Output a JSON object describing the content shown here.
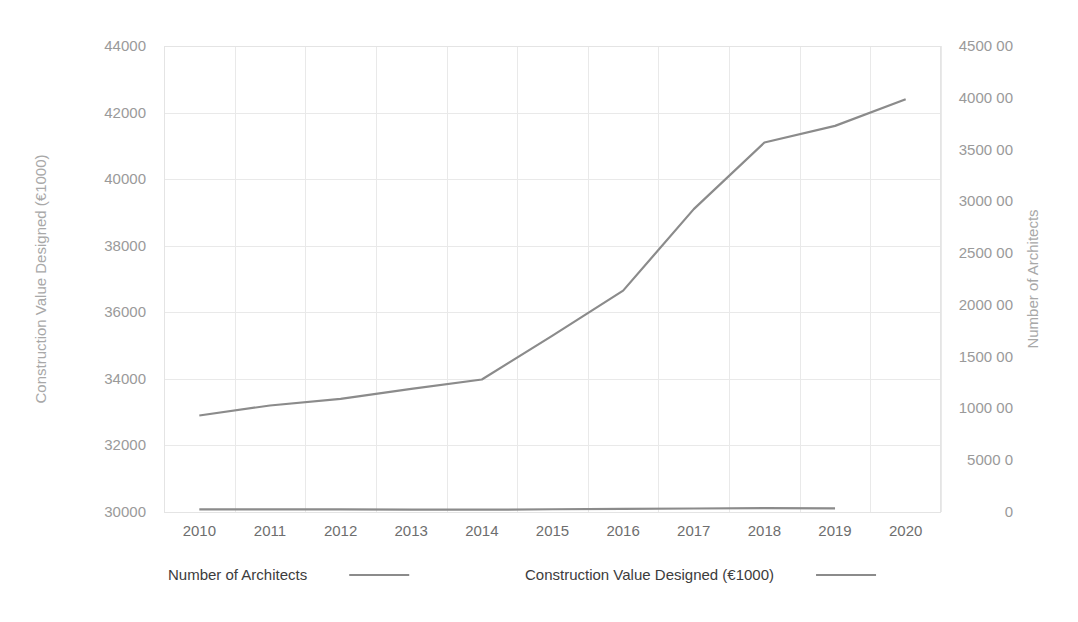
{
  "chart_data": {
    "type": "line",
    "title": "",
    "xlabel": "",
    "ylabel": "Construction Value Designed (€1000)",
    "y2label": "Number of Architects",
    "grid": true,
    "legend_position": "bottom",
    "categories": [
      "2010",
      "2011",
      "2012",
      "2013",
      "2014",
      "2015",
      "2016",
      "2017",
      "2018",
      "2019",
      "2020"
    ],
    "x_tick_labels": [
      "2010",
      "2011",
      "2012",
      "2013",
      "2014",
      "2015",
      "2016",
      "2017",
      "2018",
      "2019",
      "2020"
    ],
    "ylim": [
      30000,
      44000
    ],
    "y_tick_labels": [
      "44000",
      "42000",
      "40000",
      "38000",
      "36000",
      "34000",
      "32000",
      "30000"
    ],
    "y_tick_values": [
      44000,
      42000,
      40000,
      38000,
      36000,
      34000,
      32000,
      30000
    ],
    "y2lim": [
      0,
      450000
    ],
    "y2_tick_labels": [
      "4500 00",
      "4000 00",
      "3500 00",
      "3000 00",
      "2500 00",
      "2000 00",
      "1500 00",
      "1000 00",
      "5000 0",
      "0"
    ],
    "y2_tick_values": [
      450000,
      400000,
      350000,
      300000,
      250000,
      200000,
      150000,
      100000,
      50000,
      0
    ],
    "series": [
      {
        "name": "Number of Architects",
        "axis": "right",
        "x": [
          "2010",
          "2011",
          "2012",
          "2013",
          "2014",
          "2015",
          "2016",
          "2017",
          "2018",
          "2019"
        ],
        "values": [
          2500,
          2480,
          2450,
          2340,
          2200,
          2650,
          3050,
          3400,
          3680,
          3570
        ]
      },
      {
        "name": "Construction Value Designed (€1000)",
        "axis": "left",
        "x": [
          "2010",
          "2011",
          "2012",
          "2013",
          "2014",
          "2015",
          "2016",
          "2017",
          "2018",
          "2019",
          "2020"
        ],
        "values": [
          32900,
          33200,
          33400,
          33700,
          33980,
          35300,
          36650,
          39100,
          41100,
          41600,
          42400
        ]
      }
    ],
    "legend": [
      {
        "label": "Number of Architects",
        "color": "#8b8b8b"
      },
      {
        "label": "Construction Value Designed (€1000)",
        "color": "#8b8b8b"
      }
    ],
    "colors": {
      "line": "#8b8b8b",
      "grid": "#e9e9e9",
      "axis_text": "#9a9a9a",
      "axis_title": "#a8a8a8",
      "legend_text": "#3c3c3c",
      "background": "#ffffff"
    }
  }
}
